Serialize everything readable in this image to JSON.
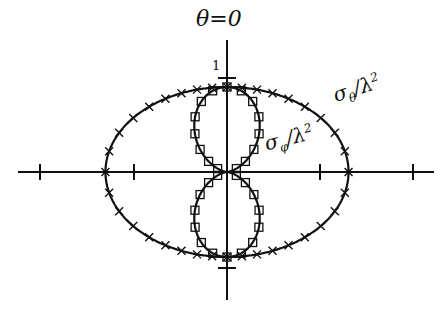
{
  "chart_data": {
    "type": "polar",
    "title": "",
    "axis_labels": {
      "top": "θ=0",
      "scale_tick": "1"
    },
    "series": [
      {
        "name": "σθ/λ²",
        "label_main": "σ",
        "label_sub": "θ",
        "label_rest": "/λ",
        "label_sup": "2",
        "curve": "outer oval",
        "marker": "x",
        "r_vertical": 1.0,
        "r_horizontal": 1.43
      },
      {
        "name": "σφ/λ²",
        "label_main": "σ",
        "label_sub": "φ",
        "label_rest": "/λ",
        "label_sup": "2",
        "curve": "figure-eight (cos²θ)",
        "marker": "square",
        "r_vertical": 1.0,
        "r_horizontal": 0.0
      }
    ],
    "ticks": {
      "horizontal": [
        -1.38,
        1.09,
        -0.11,
        1.09,
        2.18
      ],
      "vertical": [
        1.11,
        -1.13
      ]
    },
    "grid": false,
    "legend": "inline labels"
  },
  "labels": {
    "theta_zero": "θ=0",
    "one": "1"
  }
}
